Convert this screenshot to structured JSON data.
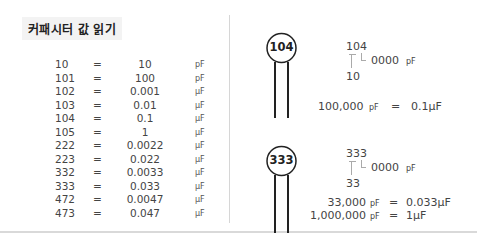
{
  "title": "커패시터 값 읽기",
  "table": {
    "rows": [
      {
        "code": "10",
        "eq": "=",
        "value": "10",
        "unit": "pF"
      },
      {
        "code": "101",
        "eq": "=",
        "value": "100",
        "unit": "pF"
      },
      {
        "code": "102",
        "eq": "=",
        "value": "0.001",
        "unit": "μF"
      },
      {
        "code": "103",
        "eq": "=",
        "value": "0.01",
        "unit": "μF"
      },
      {
        "code": "104",
        "eq": "=",
        "value": "0.1",
        "unit": "μF"
      },
      {
        "code": "105",
        "eq": "=",
        "value": "1",
        "unit": "μF"
      },
      {
        "code": "222",
        "eq": "=",
        "value": "0.0022",
        "unit": "μF"
      },
      {
        "code": "223",
        "eq": "=",
        "value": "0.022",
        "unit": "μF"
      },
      {
        "code": "332",
        "eq": "=",
        "value": "0.0033",
        "unit": "μF"
      },
      {
        "code": "333",
        "eq": "=",
        "value": "0.033",
        "unit": "μF"
      },
      {
        "code": "472",
        "eq": "=",
        "value": "0.0047",
        "unit": "μF"
      },
      {
        "code": "473",
        "eq": "=",
        "value": "0.047",
        "unit": "μF"
      }
    ]
  },
  "example1": {
    "cap_label": "104",
    "code": "104",
    "multiplier": "0000",
    "multiplier_unit": "pF",
    "base": "10",
    "result_pf": "100,000",
    "result_pf_unit": "pF",
    "eq": "=",
    "result_uf": "0.1μF"
  },
  "example2": {
    "cap_label": "333",
    "code": "333",
    "multiplier": "0000",
    "multiplier_unit": "pF",
    "base": "33",
    "result_pf": "33,000",
    "result_pf_unit": "pF",
    "eq": "=",
    "result_uf": "0.033μF",
    "result2_pf": "1,000,000",
    "result2_pf_unit": "pF",
    "eq2": "=",
    "result2_uf": "1μF"
  }
}
